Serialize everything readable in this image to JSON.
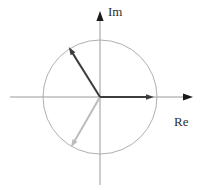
{
  "figure": {
    "labels": {
      "im": "Im",
      "re": "Re"
    },
    "colors": {
      "axis": "#9a9a9a",
      "axis_arrow": "#1a1a1a",
      "circle": "#a6a6a6",
      "dark_vector": "#3d3d3d",
      "light_vector": "#bcbcbc",
      "background": "#ffffff",
      "label_text": "#2e2e2e"
    },
    "center": {
      "x": 100,
      "y": 97
    },
    "radius": 57,
    "re_axis": {
      "x_start": 10,
      "x_end": 184,
      "y": 97,
      "arrow_tip_x": 193
    },
    "im_axis": {
      "y_start": 185,
      "y_end": 21,
      "x": 100,
      "arrow_tip_y": 11
    },
    "vectors": [
      {
        "name": "phasor-240",
        "angle_deg": -120,
        "length": 58,
        "color": "light_vector",
        "arrow": true
      },
      {
        "name": "phasor-120",
        "angle_deg": 122,
        "length": 59,
        "color": "dark_vector",
        "arrow": true
      },
      {
        "name": "phasor-0",
        "angle_deg": 0,
        "length": 54,
        "color": "dark_vector",
        "arrow": true
      }
    ]
  }
}
